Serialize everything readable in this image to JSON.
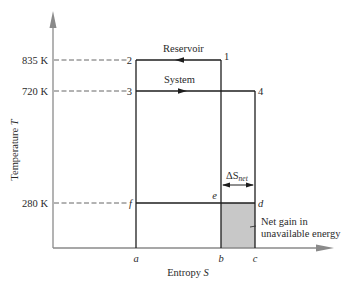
{
  "diagram": {
    "type": "T-S diagram",
    "axes": {
      "y_label": "Temperature",
      "y_symbol": "T",
      "x_label": "Entropy",
      "x_symbol": "S"
    },
    "temperatures": [
      {
        "label": "835 K",
        "value_K": 835,
        "point": "2"
      },
      {
        "label": "720 K",
        "value_K": 720,
        "point": "3"
      },
      {
        "label": "280 K",
        "value_K": 280,
        "point": "f"
      }
    ],
    "entropy_marks": [
      "a",
      "b",
      "c"
    ],
    "points": {
      "p1": "1",
      "p2": "2",
      "p3": "3",
      "p4": "4",
      "e": "e",
      "d": "d",
      "f": "f"
    },
    "process_labels": {
      "reservoir": "Reservoir",
      "system": "System"
    },
    "delta_s": {
      "symbol": "ΔS",
      "subscript": "net"
    },
    "annotation": {
      "line1": "Net gain in",
      "line2": "unavailable energy"
    },
    "colors": {
      "shaded_area": "#c8c8c8",
      "axis": "#8a8a8a",
      "lines": "#1e1e1e"
    }
  }
}
